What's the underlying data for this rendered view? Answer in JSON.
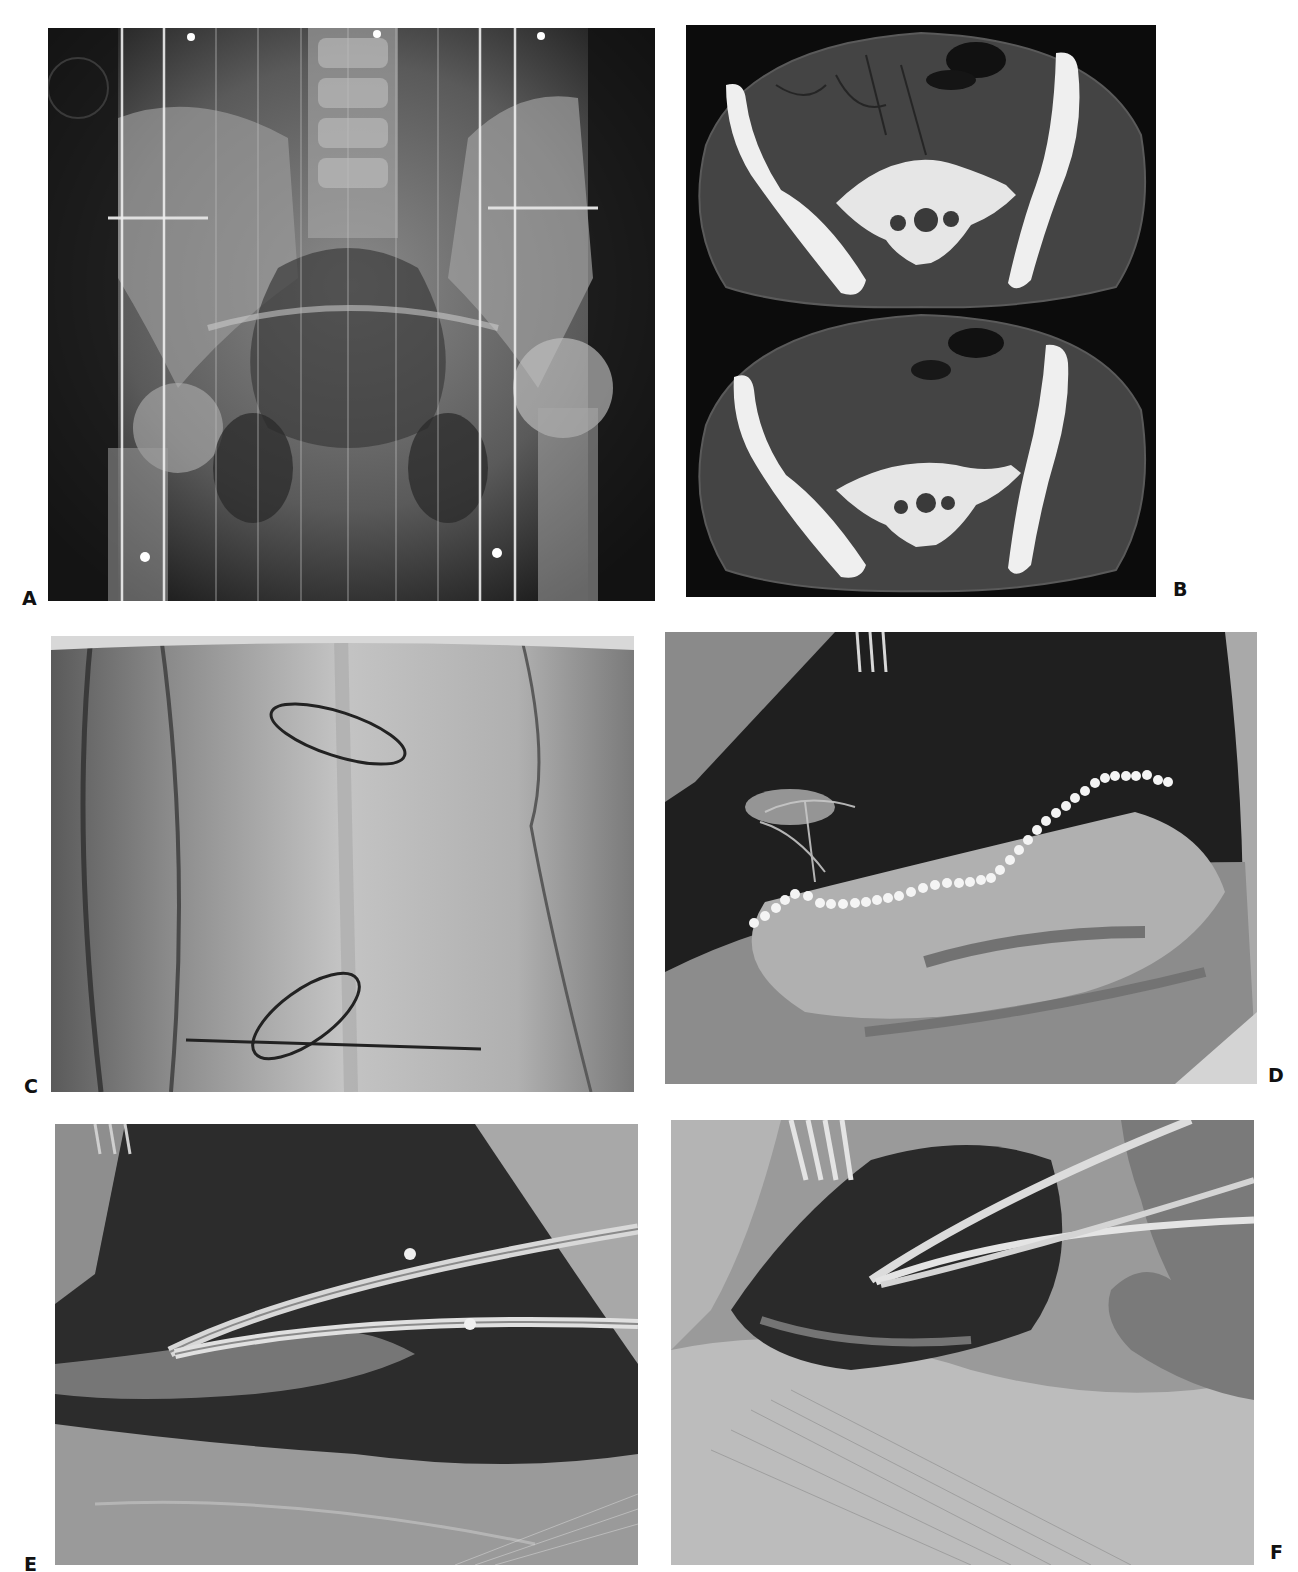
{
  "figure": {
    "panels": [
      {
        "id": "A",
        "label": "A",
        "kind": "radiograph",
        "description": "AP pelvis X-ray with vertical positioning lines and marker dots"
      },
      {
        "id": "B",
        "label": "B",
        "kind": "ct-axial",
        "description": "Two axial CT slices through the pelvis at the sacroiliac level"
      },
      {
        "id": "C",
        "label": "C",
        "kind": "clinical-photo",
        "description": "Skin surface with drawn elliptical incision markings"
      },
      {
        "id": "D",
        "label": "D",
        "kind": "intraoperative-photo",
        "description": "Surgical exposure with white dotted line marking a boundary"
      },
      {
        "id": "E",
        "label": "E",
        "kind": "intraoperative-photo",
        "description": "Surgical field with curved clamps/forceps"
      },
      {
        "id": "F",
        "label": "F",
        "kind": "intraoperative-photo",
        "description": "Surgical field with retractor and curved instruments, gloved hand"
      }
    ]
  },
  "colors": {
    "background": "#ffffff",
    "label": "#111111",
    "xray_dark": "#151515",
    "xray_mid": "#6e6e6e",
    "bone_white": "#f2f2f2",
    "ct_soft": "#4a4a4a",
    "skin": "#b9b9b9",
    "tissue_dark": "#2a2a2a",
    "dots": "#f4f4f4"
  }
}
